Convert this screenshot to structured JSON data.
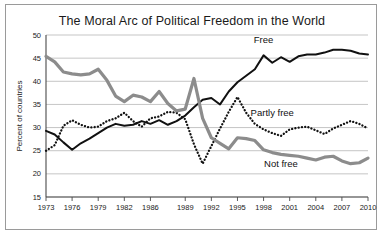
{
  "chart_data": {
    "type": "line",
    "title": "The Moral Arc of Political Freedom in the World",
    "xlabel": "",
    "ylabel": "Percent of countries",
    "xlim": [
      1973,
      2010
    ],
    "ylim": [
      15,
      50
    ],
    "yticks": [
      15,
      20,
      25,
      30,
      35,
      40,
      45,
      50
    ],
    "xticks": [
      1973,
      1976,
      1979,
      1982,
      1985,
      1989,
      1992,
      1995,
      1998,
      2001,
      2004,
      2007,
      2010
    ],
    "xtick_labels": [
      "1973",
      "1976",
      "1979",
      "1982",
      "1986",
      "1989",
      "1992",
      "1995",
      "1998",
      "2001",
      "2004",
      "2007",
      "2010"
    ],
    "grid": true,
    "legend": "inline-annotations",
    "x": [
      1973,
      1974,
      1975,
      1976,
      1977,
      1978,
      1979,
      1980,
      1981,
      1982,
      1983,
      1984,
      1985,
      1986,
      1987,
      1988,
      1989,
      1990,
      1991,
      1992,
      1993,
      1994,
      1995,
      1996,
      1997,
      1998,
      1999,
      2000,
      2001,
      2002,
      2003,
      2004,
      2005,
      2006,
      2007,
      2008,
      2009,
      2010
    ],
    "series": [
      {
        "name": "Free",
        "style": "solid",
        "color": "#111111",
        "label_x": 1998,
        "label_y": 48.2,
        "values": [
          29.3,
          28.5,
          26.8,
          25.2,
          26.6,
          27.6,
          28.8,
          30.0,
          30.8,
          30.4,
          30.6,
          31.4,
          30.8,
          31.6,
          30.6,
          31.4,
          32.6,
          34.4,
          36.0,
          36.4,
          35.0,
          37.8,
          39.8,
          41.2,
          42.6,
          45.6,
          44.0,
          45.2,
          44.2,
          45.4,
          45.8,
          45.8,
          46.2,
          46.8,
          46.8,
          46.6,
          46.0,
          45.8
        ]
      },
      {
        "name": "Partly free",
        "style": "dotted",
        "color": "#111111",
        "label_x": 1999,
        "label_y": 32.6,
        "values": [
          25.0,
          26.2,
          30.4,
          31.6,
          30.6,
          30.0,
          30.2,
          31.4,
          32.0,
          33.2,
          31.4,
          30.2,
          32.0,
          32.4,
          33.4,
          33.2,
          31.8,
          26.4,
          22.2,
          26.0,
          29.8,
          33.4,
          36.6,
          33.2,
          30.8,
          29.6,
          28.8,
          28.2,
          29.6,
          30.0,
          30.2,
          29.4,
          28.6,
          29.8,
          30.6,
          31.4,
          30.8,
          29.8
        ]
      },
      {
        "name": "Not free",
        "style": "thick",
        "color": "#8c8c8c",
        "label_x": 2000,
        "label_y": 21.4,
        "values": [
          45.4,
          44.2,
          42.0,
          41.6,
          41.4,
          41.6,
          42.6,
          40.2,
          36.8,
          35.6,
          37.0,
          36.6,
          35.6,
          37.8,
          35.2,
          33.6,
          34.0,
          40.6,
          32.0,
          27.8,
          26.6,
          25.4,
          27.8,
          27.6,
          27.2,
          25.2,
          24.6,
          24.2,
          24.0,
          23.8,
          23.4,
          23.0,
          23.6,
          23.8,
          22.8,
          22.2,
          22.4,
          23.4
        ]
      }
    ]
  }
}
